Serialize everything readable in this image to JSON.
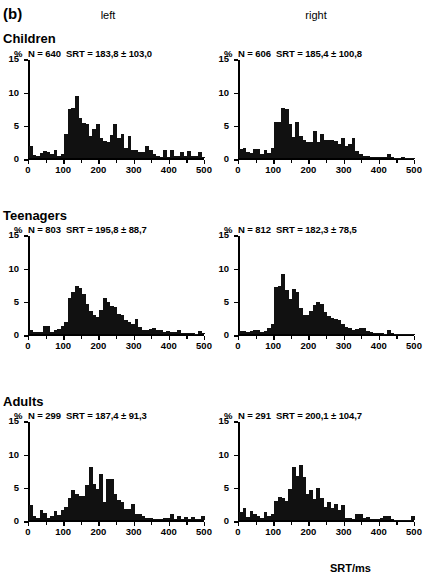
{
  "figure": {
    "panel_label": "(b)",
    "x_axis_title": "SRT/ms",
    "column_headers": [
      "left",
      "right"
    ],
    "group_titles": [
      "Children",
      "Teenagers",
      "Adults"
    ],
    "percent_symbol": "%"
  },
  "axes": {
    "y_ticks": [
      0,
      5,
      10,
      15
    ],
    "y_tick_labels": [
      "0",
      "5",
      "10",
      "15"
    ],
    "ylim": [
      0,
      15
    ],
    "x_ticks": [
      0,
      100,
      200,
      300,
      400,
      500
    ],
    "x_tick_labels": [
      "0",
      "100",
      "200",
      "300",
      "400",
      "500"
    ],
    "xlim": [
      0,
      500
    ],
    "ylabel": "%",
    "xlabel": "SRT/ms",
    "bin_width": 10
  },
  "chart_data": {
    "type": "bar",
    "xlabel": "SRT/ms",
    "ylabel": "%",
    "xlim": [
      0,
      500
    ],
    "ylim": [
      0,
      15
    ],
    "grid": false,
    "legend": "none",
    "bin_width": 10,
    "x": [
      0,
      10,
      20,
      30,
      40,
      50,
      60,
      70,
      80,
      90,
      100,
      110,
      120,
      130,
      140,
      150,
      160,
      170,
      180,
      190,
      200,
      210,
      220,
      230,
      240,
      250,
      260,
      270,
      280,
      290,
      300,
      310,
      320,
      330,
      340,
      350,
      360,
      370,
      380,
      390,
      400,
      410,
      420,
      430,
      440,
      450,
      460,
      470,
      480,
      490
    ],
    "panels": [
      {
        "group": "Children",
        "direction": "left",
        "n_label": "N = 640",
        "srt_label": "SRT = 183,8 ± 103,0",
        "n": 640,
        "srt_mean": 183.8,
        "srt_sd": 103.0,
        "values": [
          1.8,
          0.5,
          0.4,
          0.8,
          1.1,
          1.0,
          0.6,
          1.2,
          0.4,
          0.6,
          3.6,
          7.4,
          7.6,
          9.4,
          6.0,
          5.3,
          5.2,
          3.3,
          4.4,
          5.2,
          3.0,
          2.6,
          2.5,
          3.5,
          5.2,
          3.0,
          3.7,
          1.5,
          3.3,
          1.2,
          1.3,
          1.0,
          0.9,
          1.8,
          1.3,
          0.6,
          0.3,
          0.2,
          1.2,
          0.2,
          1.2,
          0.3,
          0.3,
          1.0,
          0.4,
          1.1,
          0.4,
          0.3,
          0.9,
          0.2
        ]
      },
      {
        "group": "Children",
        "direction": "right",
        "n_label": "N = 606",
        "srt_label": "SRT = 185,4 ± 100,8",
        "n": 606,
        "srt_mean": 185.4,
        "srt_sd": 100.8,
        "values": [
          1.4,
          1.5,
          0.9,
          0.8,
          1.4,
          1.4,
          0.7,
          1.3,
          0.8,
          1.6,
          5.5,
          5.4,
          7.5,
          7.4,
          5.2,
          3.2,
          5.4,
          3.3,
          2.7,
          2.5,
          2.4,
          4.1,
          2.5,
          3.6,
          2.7,
          2.7,
          2.7,
          2.6,
          2.1,
          3.0,
          1.8,
          2.2,
          3.0,
          1.1,
          0.6,
          0.3,
          0.3,
          0.2,
          0.2,
          0.2,
          0.2,
          0.2,
          0.7,
          0.2,
          0.1,
          0.1,
          0.2,
          0.1,
          0.1,
          0.1
        ]
      },
      {
        "group": "Teenagers",
        "direction": "left",
        "n_label": "N = 803",
        "srt_label": "SRT = 195,8 ± 88,7",
        "n": 803,
        "srt_mean": 195.8,
        "srt_sd": 88.7,
        "values": [
          0.6,
          0.4,
          0.3,
          0.3,
          1.2,
          1.3,
          0.4,
          0.6,
          0.8,
          1.2,
          1.8,
          5.4,
          6.4,
          7.2,
          6.9,
          6.1,
          4.6,
          3.5,
          2.9,
          2.6,
          3.6,
          5.4,
          4.9,
          4.3,
          4.1,
          3.1,
          2.9,
          2.2,
          1.9,
          1.6,
          2.3,
          1.1,
          0.6,
          0.7,
          0.8,
          1.0,
          0.7,
          0.6,
          0.4,
          0.5,
          0.3,
          0.3,
          0.6,
          0.2,
          0.2,
          0.2,
          0.2,
          0.1,
          0.5,
          0.2
        ]
      },
      {
        "group": "Teenagers",
        "direction": "right",
        "n_label": "N = 812",
        "srt_label": "SRT = 182,3 ± 78,5",
        "n": 812,
        "srt_mean": 182.3,
        "srt_sd": 78.5,
        "values": [
          0.5,
          0.5,
          0.4,
          0.5,
          0.7,
          0.6,
          0.4,
          0.5,
          0.9,
          1.6,
          7.1,
          7.3,
          9.1,
          6.6,
          5.3,
          6.8,
          6.4,
          4.0,
          2.9,
          2.9,
          3.5,
          4.4,
          4.8,
          4.6,
          3.4,
          2.8,
          2.4,
          2.3,
          2.1,
          1.6,
          1.1,
          1.0,
          0.6,
          0.8,
          1.0,
          0.9,
          0.5,
          0.3,
          0.2,
          0.2,
          0.2,
          0.1,
          0.6,
          0.2,
          0.1,
          0.1,
          0.1,
          0.1,
          0.1,
          0.1
        ]
      },
      {
        "group": "Adults",
        "direction": "left",
        "n_label": "N = 299",
        "srt_label": "SRT = 187,4 ± 91,3",
        "n": 299,
        "srt_mean": 187.4,
        "srt_sd": 91.3,
        "values": [
          2.3,
          0.6,
          0.4,
          1.5,
          1.1,
          0.4,
          0.7,
          1.4,
          0.8,
          1.5,
          2.0,
          3.4,
          4.6,
          4.0,
          3.6,
          3.6,
          5.3,
          8.0,
          5.5,
          4.7,
          7.0,
          2.8,
          6.2,
          6.2,
          4.0,
          3.1,
          2.7,
          1.7,
          1.7,
          2.5,
          0.9,
          1.0,
          0.6,
          0.4,
          0.3,
          0.2,
          0.2,
          0.2,
          0.3,
          0.3,
          1.0,
          0.2,
          0.6,
          0.2,
          0.5,
          0.2,
          0.5,
          0.2,
          0.2,
          0.6
        ]
      },
      {
        "group": "Adults",
        "direction": "right",
        "n_label": "N = 291",
        "srt_label": "SRT = 200,1 ± 104,7",
        "n": 291,
        "srt_mean": 200.1,
        "srt_sd": 104.7,
        "values": [
          1.3,
          1.8,
          0.5,
          1.4,
          1.0,
          0.7,
          0.4,
          1.2,
          0.7,
          0.9,
          2.9,
          3.5,
          3.4,
          2.9,
          4.7,
          8.0,
          6.7,
          8.3,
          6.5,
          4.0,
          4.5,
          3.2,
          4.8,
          3.4,
          2.0,
          2.8,
          1.9,
          2.5,
          1.5,
          2.3,
          0.3,
          0.3,
          0.2,
          1.0,
          1.0,
          0.4,
          0.5,
          0.2,
          0.2,
          0.2,
          0.3,
          0.6,
          0.6,
          0.2,
          0.1,
          0.1,
          0.1,
          0.1,
          0.1,
          0.6
        ]
      }
    ]
  }
}
